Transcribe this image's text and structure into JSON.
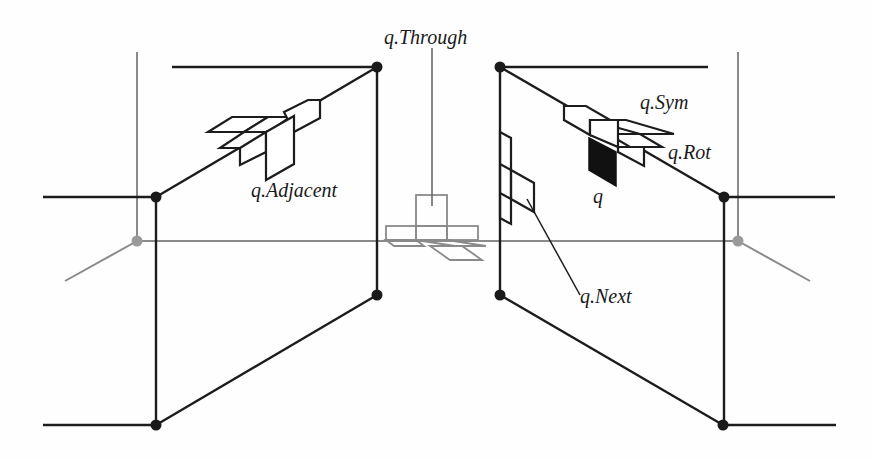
{
  "diagram": {
    "type": "perspective two-plane cube-net neighborhood diagram",
    "colors": {
      "primary_line": "#1c1c1c",
      "secondary_line": "#8a8a8a",
      "node_dark": "#1a1a1a",
      "node_gray": "#9a9a9a",
      "filled_face": "#111111",
      "background": "#fefefe"
    },
    "labels": {
      "through": "q.Through",
      "adjacent": "q.Adjacent",
      "sym": "q.Sym",
      "rot": "q.Rot",
      "q": "q",
      "next": "q.Next"
    },
    "left_panel": {
      "nodes": [
        {
          "id": "L-top-right",
          "x": 377,
          "y": 67
        },
        {
          "id": "L-mid-left",
          "x": 156,
          "y": 197
        },
        {
          "id": "L-bottom-right",
          "x": 377,
          "y": 295
        },
        {
          "id": "L-bottom-left",
          "x": 156,
          "y": 425
        }
      ]
    },
    "right_panel": {
      "nodes": [
        {
          "id": "R-top-left",
          "x": 500,
          "y": 67
        },
        {
          "id": "R-mid-right",
          "x": 724,
          "y": 197
        },
        {
          "id": "R-bottom-left",
          "x": 500,
          "y": 295
        },
        {
          "id": "R-bottom-right",
          "x": 723,
          "y": 425
        }
      ]
    },
    "gray_nodes": [
      {
        "id": "G-left",
        "x": 137,
        "y": 241
      },
      {
        "id": "G-right",
        "x": 738,
        "y": 241
      }
    ]
  }
}
